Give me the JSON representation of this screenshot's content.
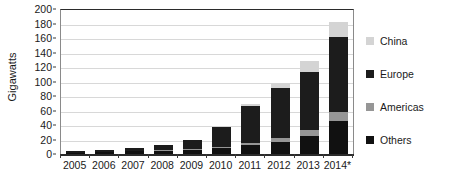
{
  "chart_data": {
    "type": "bar",
    "stacked": true,
    "title": "",
    "xlabel": "",
    "ylabel": "Gigawatts",
    "ylim": [
      0,
      200
    ],
    "ytick_step": 20,
    "yticks": [
      0,
      20,
      40,
      60,
      80,
      100,
      120,
      140,
      160,
      180,
      200
    ],
    "grid": true,
    "legend_position": "right",
    "categories": [
      "2005",
      "2006",
      "2007",
      "2008",
      "2009",
      "2010",
      "2011",
      "2012",
      "2013",
      "2014*"
    ],
    "series": [
      {
        "name": "Others",
        "color": "#111111",
        "values": [
          3,
          4,
          6,
          6,
          7,
          9,
          14,
          18,
          26,
          47
        ]
      },
      {
        "name": "Americas",
        "color": "#969696",
        "values": [
          0,
          0,
          0,
          1,
          1,
          2,
          3,
          5,
          8,
          13
        ]
      },
      {
        "name": "Europe",
        "color": "#1c1c1c",
        "values": [
          2,
          3,
          4,
          7,
          13,
          28,
          50,
          70,
          80,
          103
        ]
      },
      {
        "name": "China",
        "color": "#d4d4d4",
        "values": [
          0,
          0,
          0,
          0,
          0,
          1,
          3,
          7,
          15,
          20
        ]
      }
    ],
    "totals": [
      5,
      7,
      10,
      14,
      21,
      40,
      70,
      100,
      129,
      183
    ]
  },
  "legend": {
    "items": [
      {
        "label": "China",
        "color": "#d4d4d4"
      },
      {
        "label": "Europe",
        "color": "#1c1c1c"
      },
      {
        "label": "Americas",
        "color": "#969696"
      },
      {
        "label": "Others",
        "color": "#111111"
      }
    ]
  }
}
